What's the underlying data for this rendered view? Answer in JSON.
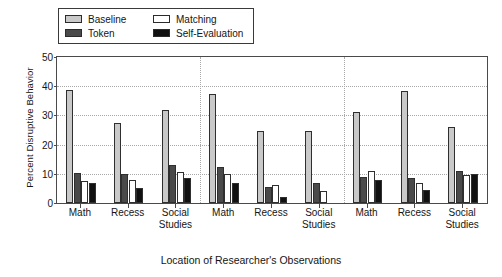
{
  "chart_data": {
    "type": "bar",
    "title": "",
    "xlabel": "Location of Researcher's Observations",
    "ylabel": "Percent Disruptive Behavior",
    "ylim": [
      0,
      50
    ],
    "yticks": [
      0,
      10,
      20,
      30,
      40,
      50
    ],
    "grid": true,
    "legend_position": "top-left",
    "panels": [
      "Student 1",
      "Student 2",
      "Student 3"
    ],
    "categories": [
      "Math",
      "Recess",
      "Social\nStudies",
      "Math",
      "Recess",
      "Social\nStudies",
      "Math",
      "Recess",
      "Social\nStudies"
    ],
    "series": [
      {
        "name": "Baseline",
        "color": "#c9c9c9",
        "values": [
          38.7,
          27.5,
          32.0,
          37.5,
          24.5,
          24.5,
          31.0,
          38.5,
          26.0
        ]
      },
      {
        "name": "Token",
        "color": "#4a4a4a",
        "values": [
          10.2,
          9.8,
          13.0,
          12.5,
          5.5,
          7.0,
          9.0,
          8.5,
          11.0
        ]
      },
      {
        "name": "Matching",
        "color": "#ffffff",
        "values": [
          7.5,
          8.0,
          10.5,
          10.0,
          6.0,
          4.0,
          11.0,
          7.0,
          9.5
        ]
      },
      {
        "name": "Self-Evaluation",
        "color": "#111111",
        "values": [
          7.0,
          5.0,
          8.5,
          7.0,
          2.0,
          0.0,
          8.0,
          4.5,
          10.0
        ]
      }
    ]
  },
  "legend": {
    "entries": [
      {
        "label": "Baseline",
        "swatch": "light-gray"
      },
      {
        "label": "Matching",
        "swatch": "white"
      },
      {
        "label": "Token",
        "swatch": "dark-gray"
      },
      {
        "label": "Self-Evaluation",
        "swatch": "black"
      }
    ]
  }
}
